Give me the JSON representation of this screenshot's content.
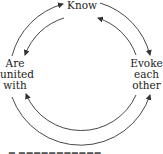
{
  "diagram": {
    "type": "cycle",
    "nodes": {
      "know": {
        "label": "Know"
      },
      "are_united_with": {
        "lines": [
          "Are",
          "united",
          "with"
        ]
      },
      "evoke_each_other": {
        "lines": [
          "Evoke",
          "each",
          "other"
        ]
      }
    },
    "edges": [
      {
        "from": "are_united_with",
        "to": "know",
        "loop": "outer"
      },
      {
        "from": "know",
        "to": "evoke_each_other",
        "loop": "outer"
      },
      {
        "from": "are_united_with",
        "to": "evoke_each_other",
        "loop": "outer"
      },
      {
        "from": "evoke_each_other",
        "to": "know",
        "loop": "inner"
      },
      {
        "from": "know",
        "to": "are_united_with",
        "loop": "inner"
      },
      {
        "from": "evoke_each_other",
        "to": "are_united_with",
        "loop": "inner"
      }
    ],
    "stroke_color": "#333333",
    "caption_visible": "partially cut off, illegible"
  }
}
